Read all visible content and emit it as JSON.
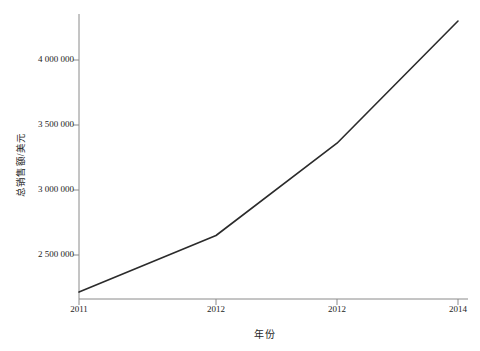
{
  "chart_data": {
    "type": "line",
    "title": "",
    "xlabel": "年份",
    "ylabel": "总销售额/美元",
    "categories": [
      "2011",
      "2012",
      "2012",
      "2014"
    ],
    "x": [
      2011,
      2012,
      2013,
      2014
    ],
    "values": [
      2215000,
      2650000,
      3360000,
      4300000
    ],
    "series": [
      {
        "name": "总销售额",
        "values": [
          2215000,
          2650000,
          3360000,
          4300000
        ]
      }
    ],
    "y_tick_labels": [
      "4 000 000",
      "3 500 000",
      "3 000 000",
      "2 500 000"
    ],
    "y_tick_values": [
      4000000,
      3500000,
      3000000,
      2500000
    ],
    "x_tick_labels": [
      "2011",
      "2012",
      "2012",
      "2014"
    ],
    "ylim": [
      2150000,
      4400000
    ],
    "grid": false,
    "legend": false,
    "line_color": "#2b2b2b",
    "axis_color": "#8a8a8a",
    "background_color": "#ffffff"
  },
  "axes": {
    "y_title": "总销售额/美元",
    "x_title": "年份"
  }
}
